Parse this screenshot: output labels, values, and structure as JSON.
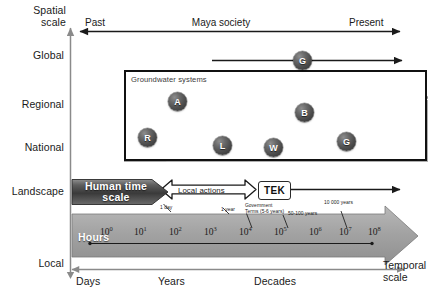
{
  "figure": {
    "y_axis": {
      "title_line1": "Spatial",
      "title_line2": "scale",
      "ticks": [
        "Global",
        "Regional",
        "National",
        "Landscape",
        "Local"
      ]
    },
    "x_axis": {
      "title_line1": "Temporal",
      "title_line2": "scale",
      "ticks": [
        "Days",
        "Years",
        "Decades"
      ]
    },
    "top_timeline": {
      "left_label": "Past",
      "center_label": "Maya society",
      "right_label": "Present",
      "global_marker": "G"
    },
    "groundwater_panel": {
      "title": "Groundwater systems",
      "markers": [
        {
          "label": "A"
        },
        {
          "label": "R"
        },
        {
          "label": "L"
        },
        {
          "label": "W"
        },
        {
          "label": "B"
        },
        {
          "label": "G"
        }
      ],
      "sun_icon": "sun-icon",
      "cloud_icon": "cloud-icon"
    },
    "human_time_scale": {
      "line1": "Human time",
      "line2": "scale"
    },
    "local_actions_label": "Local actions",
    "tek_label": "TEK",
    "timeline": {
      "unit_label": "Hours",
      "exponents": [
        "0",
        "1",
        "2",
        "3",
        "4",
        "5",
        "6",
        "7",
        "8"
      ],
      "base": "10"
    },
    "annotations": {
      "one_day": "1 day",
      "one_year": "1 year",
      "government_terms_line1": "Government",
      "government_terms_line2": "Terms (5-6 years)",
      "fifty_hundred_years": "50-100 years",
      "ten_thousand_years": "10 000 years"
    },
    "colors": {
      "axis": "#8a8a8a",
      "arrow_dark": "#1a1a1a",
      "band_fill": "#a6a6a6",
      "terrain_fill": "#a8a8a8",
      "marker_dark": "#4a4a4a",
      "panel_border": "#111111"
    }
  }
}
